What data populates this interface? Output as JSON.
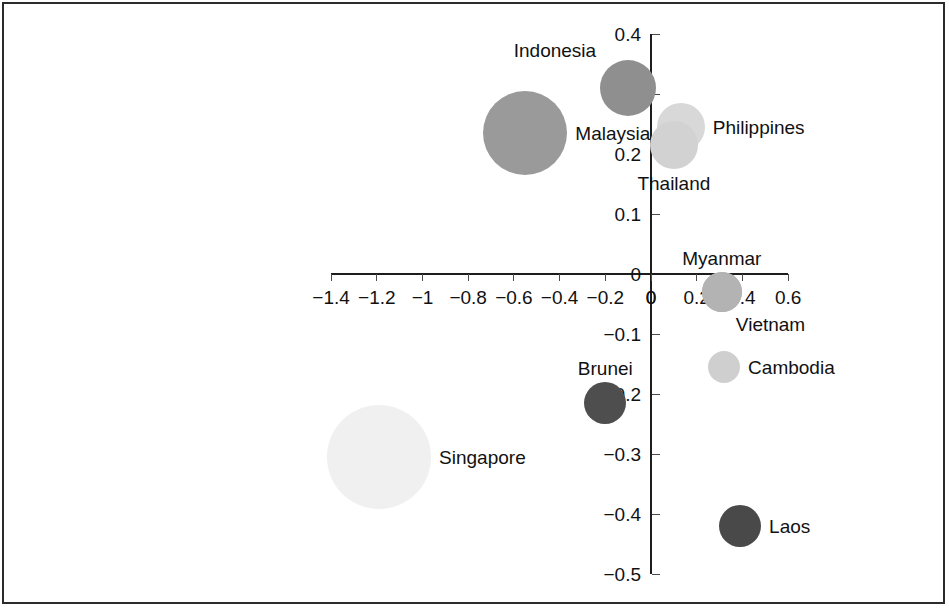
{
  "chart_data": {
    "type": "scatter",
    "title": "",
    "subtitle": "",
    "xlabel": "",
    "ylabel": "",
    "xlim": [
      -1.4,
      0.6
    ],
    "ylim": [
      -0.5,
      0.4
    ],
    "grid": false,
    "legend": "none",
    "xticks": [
      "−1.4",
      "−1.2",
      "−1",
      "−0.8",
      "−0.6",
      "−0.4",
      "−0.2",
      "0",
      "0.2",
      "0.4",
      "0.6"
    ],
    "xtick_values": [
      -1.4,
      -1.2,
      -1.0,
      -0.8,
      -0.6,
      -0.4,
      -0.2,
      0,
      0.2,
      0.4,
      0.6
    ],
    "yticks": [
      "0.4",
      "0.3",
      "0.2",
      "0.1",
      "0",
      "−0.1",
      "−0.2",
      "−0.3",
      "−0.4",
      "−0.5"
    ],
    "ytick_values": [
      0.4,
      0.3,
      0.2,
      0.1,
      0,
      -0.1,
      -0.2,
      -0.3,
      -0.4,
      -0.5
    ],
    "origin_label_x": "0",
    "origin_label_y": "0",
    "points": [
      {
        "label": "Singapore",
        "x": -1.19,
        "y": -0.305,
        "r": 52,
        "color": "#f0f0f0",
        "label_pos": "right"
      },
      {
        "label": "Malaysia",
        "x": -0.55,
        "y": 0.235,
        "r": 42,
        "color": "#9a9a9a",
        "label_pos": "right"
      },
      {
        "label": "Indonesia",
        "x": -0.1,
        "y": 0.31,
        "r": 28,
        "color": "#8f8f8f",
        "label_pos": "above-left"
      },
      {
        "label": "Brunei",
        "x": -0.2,
        "y": -0.215,
        "r": 21,
        "color": "#4e4e4e",
        "label_pos": "above"
      },
      {
        "label": "Philippines",
        "x": 0.13,
        "y": 0.245,
        "r": 24,
        "color": "#d8d8d8",
        "label_pos": "right"
      },
      {
        "label": "Thailand",
        "x": 0.1,
        "y": 0.215,
        "r": 24,
        "color": "#d2d2d2",
        "label_pos": "below"
      },
      {
        "label": "Myanmar",
        "x": 0.31,
        "y": -0.03,
        "r": 20,
        "color": "#b3b3b3",
        "label_pos": "above"
      },
      {
        "label": "Vietnam",
        "x": 0.31,
        "y": -0.03,
        "r": 20,
        "color": "#b3b3b3",
        "label_pos": "below-right"
      },
      {
        "label": "Cambodia",
        "x": 0.32,
        "y": -0.155,
        "r": 16,
        "color": "#cfcfcf",
        "label_pos": "right"
      },
      {
        "label": "Laos",
        "x": 0.39,
        "y": -0.42,
        "r": 21,
        "color": "#494949",
        "label_pos": "right"
      }
    ]
  },
  "colors": {
    "axis": "#1d1d1d",
    "tick": "#4a4a4a",
    "text": "#111111",
    "frame": "#2b2b2b",
    "background": "#ffffff"
  }
}
